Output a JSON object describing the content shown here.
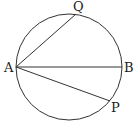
{
  "diagram": {
    "type": "circle-geometry",
    "circle": {
      "cx": 69,
      "cy": 67,
      "r": 53
    },
    "points": {
      "A": {
        "label": "A",
        "x": 16,
        "y": 67
      },
      "B": {
        "label": "B",
        "x": 122,
        "y": 67
      },
      "Q": {
        "label": "Q",
        "x": 76,
        "y": 14
      },
      "P": {
        "label": "P",
        "x": 110,
        "y": 101
      }
    },
    "segments": [
      [
        "A",
        "B"
      ],
      [
        "A",
        "Q"
      ],
      [
        "A",
        "P"
      ]
    ],
    "colors": {
      "stroke": "#333333",
      "background": "#ffffff"
    }
  }
}
